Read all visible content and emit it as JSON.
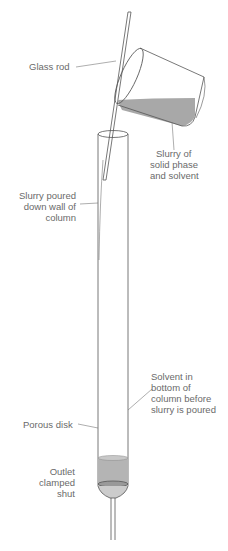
{
  "diagram": {
    "type": "column packing (slurry method)",
    "labels": {
      "glass_rod": "Glass rod",
      "slurry": [
        "Slurry of",
        "solid phase",
        "and solvent"
      ],
      "slurry_poured": [
        "Slurry poured",
        "down wall of",
        "column"
      ],
      "solvent": [
        "Solvent in",
        "bottom of",
        "column before",
        "slurry is poured"
      ],
      "porous_disk": "Porous disk",
      "outlet": [
        "Outlet",
        "clamped",
        "shut"
      ]
    },
    "colors": {
      "line": "#555555",
      "liquid": "#a8a8a8",
      "text": "#6a6a6a"
    }
  }
}
